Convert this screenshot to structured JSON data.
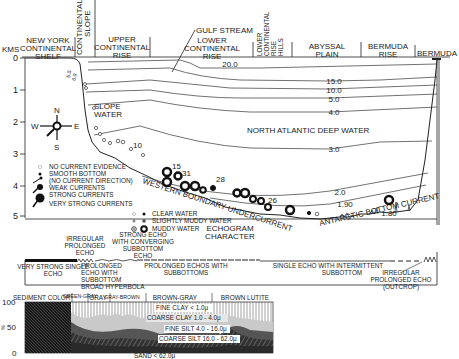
{
  "profile": {
    "depth_axis": {
      "unit": "KMS",
      "ticks": [
        "0",
        "1",
        "2",
        "3",
        "4",
        "5"
      ]
    },
    "regions": [
      {
        "id": "ny-shelf",
        "lines": [
          "NEW YORK",
          "CONTINENTAL",
          "SHELF"
        ]
      },
      {
        "id": "slope",
        "lines": [
          "CONTINENTAL",
          "SLOPE"
        ]
      },
      {
        "id": "upper-rise",
        "lines": [
          "UPPER",
          "CONTINENTAL",
          "RISE"
        ]
      },
      {
        "id": "lower-rise",
        "lines": [
          "LOWER",
          "CONTINENTAL",
          "RISE"
        ]
      },
      {
        "id": "rise-hills",
        "lines": [
          "LOWER",
          "CONTINENTAL",
          "RISE",
          "HILLS"
        ]
      },
      {
        "id": "abyssal",
        "lines": [
          "ABYSSAL",
          "PLAIN"
        ]
      },
      {
        "id": "bermuda-rise",
        "lines": [
          "BERMUDA",
          "RISE"
        ]
      },
      {
        "id": "bermuda",
        "lines": [
          "BERMUDA"
        ]
      }
    ],
    "gulf_stream": "GULF STREAM",
    "isotherms": [
      "20.0",
      "15.0",
      "10.0",
      "5.0",
      "4.0",
      "3.0",
      "2.0",
      "1.90",
      "1.80"
    ],
    "slope_labels": [
      "5.0",
      "6.0"
    ],
    "water_masses": {
      "slope_water": [
        "SLOPE",
        "WATER"
      ],
      "nadw": "NORTH ATLANTIC DEEP WATER",
      "wbuc": "WESTERN BOUNDARY UNDERCURRENT",
      "abc": "ANTARCTIC BOTTOM CURRENT"
    },
    "station_numbers": [
      "10",
      "15",
      "31",
      "28",
      "26"
    ],
    "compass": {
      "n": "N",
      "s": "S",
      "e": "E",
      "w": "W"
    },
    "legend_currents": [
      {
        "symbol": "open-circle",
        "label": "NO CURRENT EVIDENCE"
      },
      {
        "symbol": "dot",
        "label": "SMOOTH BOTTOM"
      },
      {
        "symbol": "none",
        "label": "(NO CURRENT DIRECTION)"
      },
      {
        "symbol": "small-arrow",
        "label": "WEAK CURRENTS"
      },
      {
        "symbol": "medium-arrow",
        "label": "STRONG CURRENTS"
      },
      {
        "symbol": "large-arrow",
        "label": "VERY STRONG CURRENTS"
      }
    ],
    "legend_water": [
      {
        "label": "CLEAR WATER"
      },
      {
        "label": "SLIGHTLY MUDDY WATER"
      },
      {
        "label": "MUDDY WATER"
      }
    ]
  },
  "echogram": {
    "title": [
      "ECHOGRAM",
      "CHARACTER"
    ],
    "labels": {
      "very_strong": [
        "VERY STRONG SINGLE",
        "ECHO"
      ],
      "irregular": [
        "IRREGULAR",
        "PROLONGED",
        "ECHO"
      ],
      "converging": [
        "STRONG ECHO",
        "WITH CONVERGING",
        "SUBBOTTOM",
        "ECHO"
      ],
      "hyperbola": [
        "PROLONGED",
        "ECHO WITH",
        "SUBBOTTOM",
        "BROAD HYPERBOLA"
      ],
      "prolonged": [
        "PROLONGED ECHOS WITH",
        "SUBBOTTOMS"
      ],
      "single_intermittent": [
        "SINGLE ECHO WITH INTERMITTENT",
        "SUBBOTTOM"
      ],
      "outcrop": [
        "IRREGULAR",
        "PROLONGED ECHO",
        "(OUTCROP)"
      ]
    }
  },
  "sediment": {
    "color_label": "SEDIMENT COLOR",
    "colors": [
      "GREEN-GRAY",
      "GRAY",
      "GRAY-BROWN",
      "BROWN-GRAY",
      "BROWN LUTITE"
    ],
    "y_axis": {
      "label": "%",
      "ticks": [
        "100",
        "50",
        "0"
      ]
    },
    "fractions": [
      "FINE CLAY < 1.0μ",
      "COARSE CLAY 1.0 - 4.0μ",
      "FINE SILT 4.0 - 16.0μ",
      "COARSE SILT 16.0 - 62.0μ",
      "SAND < 62.0μ"
    ]
  }
}
